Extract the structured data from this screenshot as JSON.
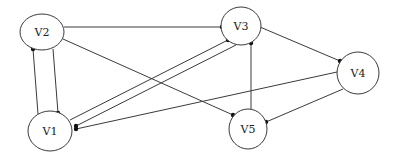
{
  "diagram": {
    "type": "directed-graph",
    "nodes": [
      {
        "id": "V1",
        "label": "V1"
      },
      {
        "id": "V2",
        "label": "V2"
      },
      {
        "id": "V3",
        "label": "V3"
      },
      {
        "id": "V4",
        "label": "V4"
      },
      {
        "id": "V5",
        "label": "V5"
      }
    ],
    "edges": [
      {
        "from": "V1",
        "to": "V2"
      },
      {
        "from": "V2",
        "to": "V1"
      },
      {
        "from": "V2",
        "to": "V3"
      },
      {
        "from": "V2",
        "to": "V5"
      },
      {
        "from": "V1",
        "to": "V3"
      },
      {
        "from": "V3",
        "to": "V1"
      },
      {
        "from": "V4",
        "to": "V1"
      },
      {
        "from": "V5",
        "to": "V3"
      },
      {
        "from": "V3",
        "to": "V4"
      },
      {
        "from": "V4",
        "to": "V5"
      }
    ],
    "colors": {
      "stroke": "#3a3a3a",
      "arrowhead": "#111111",
      "background": "#ffffff"
    }
  }
}
